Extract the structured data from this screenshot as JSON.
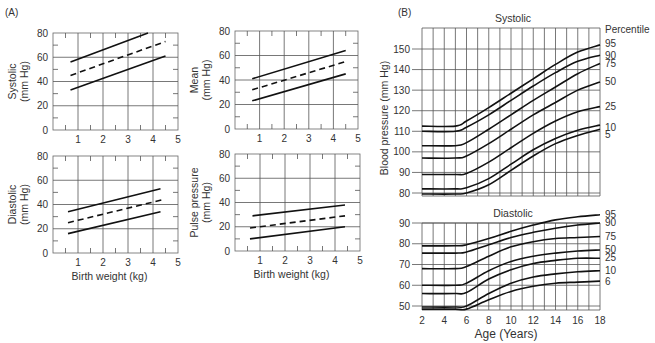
{
  "panels": {
    "a_label": "(A)",
    "b_label": "(B)"
  },
  "chart_data": [
    {
      "id": "A-systolic",
      "type": "line",
      "title": "",
      "xlabel": "",
      "ylabel": "Systolic (mm Hg)",
      "ylabel_lines": [
        "Systolic",
        "(mm Hg)"
      ],
      "xlim": [
        0,
        5
      ],
      "ylim": [
        0,
        80
      ],
      "xticks": [
        1,
        2,
        3,
        4,
        5
      ],
      "yticks": [
        0,
        20,
        40,
        60,
        80
      ],
      "grid": true,
      "series": [
        {
          "name": "upper",
          "style": "solid",
          "x": [
            0.7,
            3.8
          ],
          "y": [
            56,
            80
          ]
        },
        {
          "name": "mean",
          "style": "dashed",
          "x": [
            0.7,
            4.5
          ],
          "y": [
            45,
            73
          ]
        },
        {
          "name": "lower",
          "style": "solid",
          "x": [
            0.7,
            4.5
          ],
          "y": [
            33,
            61
          ]
        }
      ]
    },
    {
      "id": "A-mean",
      "type": "line",
      "title": "",
      "xlabel": "",
      "ylabel": "Mean (mm Hg)",
      "ylabel_lines": [
        "Mean",
        "(mm Hg)"
      ],
      "xlim": [
        0,
        5
      ],
      "ylim": [
        0,
        80
      ],
      "xticks": [
        1,
        2,
        3,
        4,
        5
      ],
      "yticks": [
        0,
        20,
        40,
        60,
        80
      ],
      "grid": true,
      "series": [
        {
          "name": "upper",
          "style": "solid",
          "x": [
            0.7,
            4.5
          ],
          "y": [
            41,
            64
          ]
        },
        {
          "name": "mean",
          "style": "dashed",
          "x": [
            0.7,
            4.5
          ],
          "y": [
            32,
            55
          ]
        },
        {
          "name": "lower",
          "style": "solid",
          "x": [
            0.7,
            4.5
          ],
          "y": [
            23,
            45
          ]
        }
      ]
    },
    {
      "id": "A-diastolic",
      "type": "line",
      "title": "",
      "xlabel": "Birth weight (kg)",
      "ylabel": "Diastolic (mm Hg)",
      "ylabel_lines": [
        "Diastolic",
        "(mm Hg)"
      ],
      "xlim": [
        0,
        5
      ],
      "ylim": [
        0,
        80
      ],
      "xticks": [
        1,
        2,
        3,
        4,
        5
      ],
      "yticks": [
        0,
        20,
        40,
        60,
        80
      ],
      "grid": true,
      "series": [
        {
          "name": "upper",
          "style": "solid",
          "x": [
            0.6,
            4.3
          ],
          "y": [
            34,
            53
          ]
        },
        {
          "name": "mean",
          "style": "dashed",
          "x": [
            0.6,
            4.4
          ],
          "y": [
            25,
            44
          ]
        },
        {
          "name": "lower",
          "style": "solid",
          "x": [
            0.6,
            4.3
          ],
          "y": [
            16,
            34
          ]
        }
      ]
    },
    {
      "id": "A-pulse",
      "type": "line",
      "title": "",
      "xlabel": "Birth weight (kg)",
      "ylabel": "Pulse pressure (mm Hg)",
      "ylabel_lines": [
        "Pulse pressure",
        "(mm Hg)"
      ],
      "xlim": [
        0,
        5
      ],
      "ylim": [
        0,
        80
      ],
      "xticks": [
        1,
        2,
        3,
        4,
        5
      ],
      "yticks": [
        0,
        20,
        40,
        60,
        80
      ],
      "grid": true,
      "series": [
        {
          "name": "upper",
          "style": "solid",
          "x": [
            0.7,
            4.4
          ],
          "y": [
            29,
            38
          ]
        },
        {
          "name": "mean",
          "style": "dashed",
          "x": [
            0.6,
            4.4
          ],
          "y": [
            19,
            29
          ]
        },
        {
          "name": "lower",
          "style": "solid",
          "x": [
            0.6,
            4.4
          ],
          "y": [
            10,
            20
          ]
        }
      ]
    },
    {
      "id": "B-systolic",
      "type": "line",
      "title": "Systolic",
      "xlabel": "",
      "ylabel": "Blood pressure (mm Hg)",
      "legend_title": "Percentile",
      "xlim": [
        2,
        18
      ],
      "ylim": [
        79,
        158
      ],
      "yticks": [
        80,
        90,
        100,
        110,
        120,
        130,
        140,
        150
      ],
      "grid": true,
      "x": [
        2,
        5,
        6,
        8,
        10,
        12,
        14,
        16,
        18
      ],
      "series": [
        {
          "name": "95",
          "values": [
            112.5,
            112.5,
            115,
            121.5,
            128.5,
            135.5,
            142.5,
            148.5,
            152
          ]
        },
        {
          "name": "90",
          "values": [
            110,
            110,
            112,
            118,
            125,
            132,
            138.5,
            144,
            147
          ]
        },
        {
          "name": "75",
          "values": [
            103,
            103,
            104.5,
            111,
            118,
            125,
            131.5,
            138,
            143
          ]
        },
        {
          "name": "50",
          "values": [
            97,
            97,
            98,
            104,
            111,
            118,
            124,
            130,
            134
          ]
        },
        {
          "name": "25",
          "values": [
            89,
            89,
            89.5,
            95,
            102,
            109,
            115,
            119.5,
            122
          ]
        },
        {
          "name": "10",
          "values": [
            82,
            82,
            82.5,
            87,
            94,
            101,
            106.5,
            110.5,
            113
          ]
        },
        {
          "name": "5",
          "values": [
            79.5,
            79.5,
            80,
            84,
            91,
            98,
            104,
            108,
            111
          ]
        }
      ]
    },
    {
      "id": "B-diastolic",
      "type": "line",
      "title": "Diastolic",
      "xlabel": "Age (Years)",
      "ylabel": "Blood pressure (mm Hg)",
      "xlim": [
        2,
        18
      ],
      "ylim": [
        48,
        90
      ],
      "xticks": [
        2,
        4,
        6,
        8,
        10,
        12,
        14,
        16,
        18
      ],
      "yticks": [
        50,
        60,
        70,
        80,
        90
      ],
      "grid": true,
      "x": [
        2,
        5,
        6,
        8,
        10,
        12,
        14,
        16,
        18
      ],
      "series": [
        {
          "name": "95",
          "values": [
            79,
            79,
            79.5,
            82.5,
            86,
            89,
            91.5,
            93,
            94
          ]
        },
        {
          "name": "90",
          "values": [
            75.5,
            75.5,
            76,
            79.5,
            83,
            85.5,
            87.5,
            89,
            90
          ]
        },
        {
          "name": "75",
          "values": [
            68,
            68,
            69,
            74,
            78.5,
            81,
            82.5,
            83,
            83.5
          ]
        },
        {
          "name": "50",
          "values": [
            60,
            60,
            61,
            67,
            71.5,
            74,
            75.5,
            76.5,
            77
          ]
        },
        {
          "name": "25",
          "values": [
            56,
            56,
            56.5,
            63,
            67.5,
            70.5,
            72,
            73,
            73
          ]
        },
        {
          "name": "10",
          "values": [
            49.5,
            49.5,
            50,
            56,
            61,
            64,
            65.5,
            66.5,
            67
          ]
        },
        {
          "name": "6",
          "values": [
            48.5,
            48.5,
            48.5,
            53,
            57,
            59.5,
            61,
            61.5,
            62
          ]
        }
      ]
    }
  ]
}
